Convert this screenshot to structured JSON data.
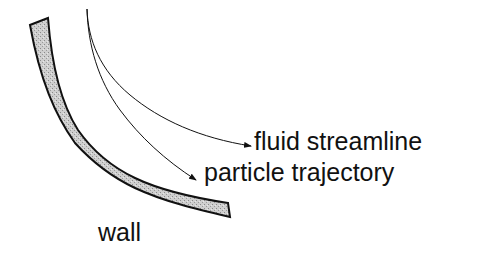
{
  "diagram": {
    "labels": {
      "fluid_streamline": "fluid streamline",
      "particle_trajectory": "particle trajectory",
      "wall": "wall"
    },
    "colors": {
      "stroke": "#111111",
      "wall_fill": "#c8c8c8",
      "background": "#ffffff"
    }
  }
}
